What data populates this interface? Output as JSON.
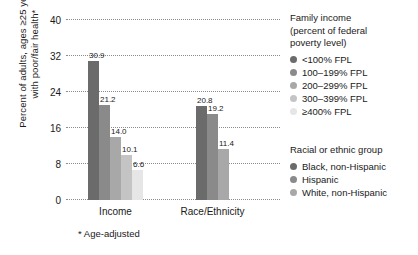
{
  "chart_data": {
    "type": "bar",
    "title": "",
    "xlabel": "",
    "ylabel": "Percent of adults, ages ≥25 years, with poor/fair health*",
    "ylabel_lines": [
      "Percent of adults, ages ≥25 years,",
      "with poor/fair health*"
    ],
    "ylim": [
      0,
      40
    ],
    "yticks": [
      0,
      8,
      16,
      24,
      32,
      40
    ],
    "ytick_labels": [
      "0",
      "8",
      "16",
      "24",
      "32",
      "40"
    ],
    "grid": true,
    "grid_style": "dotted",
    "legend_position": "right",
    "footnote": "* Age-adjusted",
    "categories": [
      "Income",
      "Race/Ethnicity"
    ],
    "groups": [
      {
        "name": "Income",
        "bars": [
          {
            "label": "<100% FPL",
            "value": 30.9,
            "value_label": "30.9",
            "color": "#6b6b6b"
          },
          {
            "label": "100–199% FPL",
            "value": 21.2,
            "value_label": "21.2",
            "color": "#8a8a8a"
          },
          {
            "label": "200–299% FPL",
            "value": 14.0,
            "value_label": "14.0",
            "color": "#a8a8a8"
          },
          {
            "label": "300–399% FPL",
            "value": 10.1,
            "value_label": "10.1",
            "color": "#c4c4c4"
          },
          {
            "label": "≥400% FPL",
            "value": 6.6,
            "value_label": "6.6",
            "color": "#e6e6e6"
          }
        ]
      },
      {
        "name": "Race/Ethnicity",
        "bars": [
          {
            "label": "Black, non-Hispanic",
            "value": 20.8,
            "value_label": "20.8",
            "color": "#6b6b6b"
          },
          {
            "label": "Hispanic",
            "value": 19.2,
            "value_label": "19.2",
            "color": "#8a8a8a"
          },
          {
            "label": "White, non-Hispanic",
            "value": 11.4,
            "value_label": "11.4",
            "color": "#a8a8a8"
          }
        ]
      }
    ]
  },
  "legend": {
    "income": {
      "title_lines": [
        "Family income",
        "(percent of federal",
        "poverty level)"
      ],
      "items": [
        {
          "label": "<100% FPL",
          "color": "#6b6b6b"
        },
        {
          "label": "100–199% FPL",
          "color": "#8a8a8a"
        },
        {
          "label": "200–299% FPL",
          "color": "#a8a8a8"
        },
        {
          "label": "300–399% FPL",
          "color": "#c4c4c4"
        },
        {
          "label": "≥400% FPL",
          "color": "#e6e6e6"
        }
      ]
    },
    "race": {
      "title_lines": [
        "Racial or ethnic group"
      ],
      "items": [
        {
          "label": "Black, non-Hispanic",
          "color": "#6b6b6b"
        },
        {
          "label": "Hispanic",
          "color": "#8a8a8a"
        },
        {
          "label": "White, non-Hispanic",
          "color": "#a8a8a8"
        }
      ]
    }
  }
}
